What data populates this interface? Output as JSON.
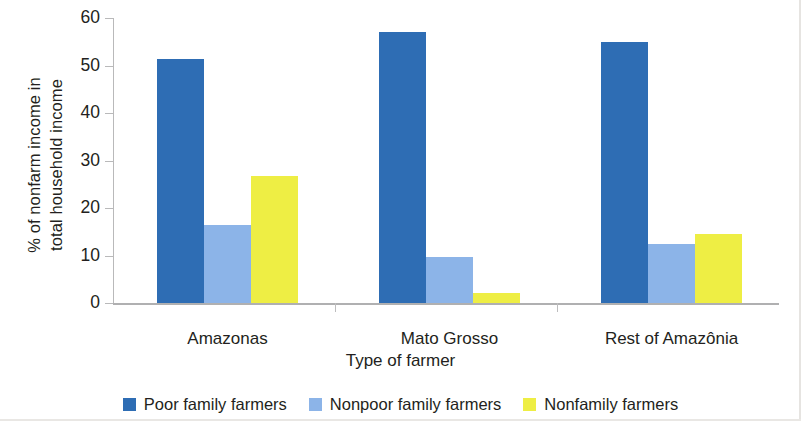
{
  "chart_data": {
    "type": "bar",
    "title": "",
    "xlabel": "Type of farmer",
    "ylabel": "% of nonfarm income in total household income",
    "ylabel_lines": [
      "% of nonfarm income in",
      "total household income"
    ],
    "categories": [
      "Amazonas",
      "Mato Grosso",
      "Rest of Amazônia"
    ],
    "series": [
      {
        "name": "Poor family farmers",
        "color": "#2E6DB4",
        "values": [
          51.3,
          57.0,
          55.0
        ]
      },
      {
        "name": "Nonpoor family farmers",
        "color": "#8CB4E8",
        "values": [
          16.5,
          9.7,
          12.4
        ]
      },
      {
        "name": "Nonfamily farmers",
        "color": "#EEEE44",
        "values": [
          26.8,
          2.2,
          14.5
        ]
      }
    ],
    "ylim": [
      0,
      60
    ],
    "ytick_labels": [
      "0",
      "10",
      "20",
      "30",
      "40",
      "50",
      "60"
    ],
    "ytick_values": [
      0,
      10,
      20,
      30,
      40,
      50,
      60
    ],
    "grid": false,
    "legend_position": "bottom",
    "axis_line_color": "#b9b9ba",
    "text_color": "#231f20"
  },
  "axes": {
    "x_title": "Type of farmer",
    "y_title_line1": "% of nonfarm income in",
    "y_title_line2": "total household income"
  },
  "legend": {
    "entries": [
      {
        "label": "Poor family farmers",
        "color": "#2E6DB4"
      },
      {
        "label": "Nonpoor family farmers",
        "color": "#8CB4E8"
      },
      {
        "label": "Nonfamily farmers",
        "color": "#EEEE44"
      }
    ]
  }
}
